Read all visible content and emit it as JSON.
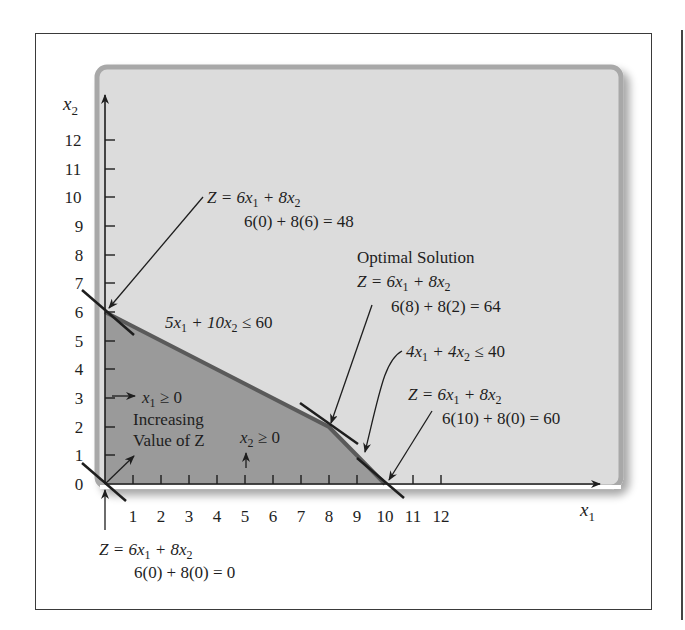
{
  "figure": {
    "axes": {
      "x_label": "x",
      "x_label_sub": "1",
      "y_label": "x",
      "y_label_sub": "2",
      "x_ticks": [
        "1",
        "2",
        "3",
        "4",
        "5",
        "6",
        "7",
        "8",
        "9",
        "10",
        "11",
        "12"
      ],
      "y_ticks": [
        "0",
        "1",
        "2",
        "3",
        "4",
        "5",
        "6",
        "7",
        "8",
        "9",
        "10",
        "11",
        "12"
      ]
    },
    "constraints": {
      "c1": {
        "a": "5x",
        "a_sub": "1",
        "b": " + 10x",
        "b_sub": "2",
        "rhs": " ≤ 60"
      },
      "c2": {
        "a": "4x",
        "a_sub": "1",
        "b": " + 4x",
        "b_sub": "2",
        "rhs": " ≤ 40"
      },
      "nonneg1": {
        "v": "x",
        "sub": "1",
        "rhs": " ≥ 0"
      },
      "nonneg2": {
        "v": "x",
        "sub": "2",
        "rhs": " ≥ 0"
      }
    },
    "increasing_z": {
      "line1": "Increasing",
      "line2": "Value of Z"
    },
    "corner_points": [
      {
        "name": "origin",
        "obj": "Z = 6x",
        "obj_sub1": "1",
        "obj_mid": " + 8x",
        "obj_sub2": "2",
        "eval": "6(0) + 8(0) = 0"
      },
      {
        "name": "y-intercept",
        "obj": "Z = 6x",
        "obj_sub1": "1",
        "obj_mid": " + 8x",
        "obj_sub2": "2",
        "eval": "6(0) + 8(6) = 48"
      },
      {
        "name": "optimal",
        "title": "Optimal Solution",
        "obj": "Z = 6x",
        "obj_sub1": "1",
        "obj_mid": " + 8x",
        "obj_sub2": "2",
        "eval": "6(8) + 8(2) = 64"
      },
      {
        "name": "x-intercept",
        "obj": "Z = 6x",
        "obj_sub1": "1",
        "obj_mid": " + 8x",
        "obj_sub2": "2",
        "eval": "6(10) + 8(0) = 60"
      }
    ],
    "colors": {
      "panel": "#dcdcdc",
      "panel_border": "#a8a8a8",
      "feasible": "#9a9a9a",
      "boundary": "#555555",
      "ink": "#1e1e1e"
    }
  }
}
